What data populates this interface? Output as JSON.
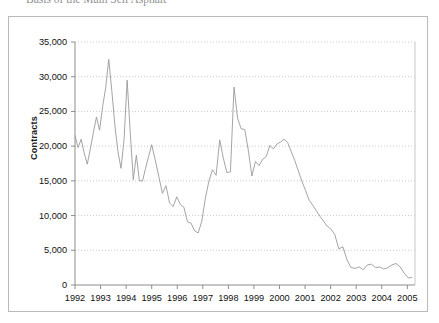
{
  "document": {
    "title_clipped": "Basis of the Main Sell  Asphalt"
  },
  "chart_data": {
    "type": "line",
    "title": "",
    "xlabel": "",
    "ylabel": "Contracts",
    "xlim": [
      1992,
      2005.3
    ],
    "ylim": [
      0,
      35000
    ],
    "grid": true,
    "grid_axis": "y",
    "legend": false,
    "line_color": "#9a9a9a",
    "ytick_labels": [
      "35,000",
      "30,000",
      "25,000",
      "20,000",
      "15,000",
      "10,000",
      "5,000",
      "0"
    ],
    "ytick_values": [
      35000,
      30000,
      25000,
      20000,
      15000,
      10000,
      5000,
      0
    ],
    "xtick_labels": [
      "1992",
      "1993",
      "1994",
      "1995",
      "1996",
      "1997",
      "1998",
      "1999",
      "2000",
      "2001",
      "2002",
      "2003",
      "2004",
      "2005"
    ],
    "xtick_values": [
      1992,
      1993,
      1994,
      1995,
      1996,
      1997,
      1998,
      1999,
      2000,
      2001,
      2002,
      2003,
      2004,
      2005
    ],
    "series": [
      {
        "name": "Contracts",
        "x": [
          1992.0,
          1992.12,
          1992.24,
          1992.36,
          1992.48,
          1992.6,
          1992.72,
          1992.84,
          1992.96,
          1993.08,
          1993.2,
          1993.32,
          1993.44,
          1993.56,
          1993.68,
          1993.8,
          1993.92,
          1994.04,
          1994.16,
          1994.28,
          1994.4,
          1994.52,
          1994.64,
          1994.76,
          1994.88,
          1995.0,
          1995.14,
          1995.28,
          1995.42,
          1995.56,
          1995.7,
          1995.84,
          1995.98,
          1996.12,
          1996.26,
          1996.4,
          1996.54,
          1996.68,
          1996.82,
          1996.96,
          1997.1,
          1997.24,
          1997.38,
          1997.52,
          1997.66,
          1997.8,
          1997.94,
          1998.08,
          1998.22,
          1998.36,
          1998.5,
          1998.64,
          1998.78,
          1998.92,
          1999.06,
          1999.2,
          1999.34,
          1999.48,
          1999.62,
          1999.76,
          1999.9,
          2000.04,
          2000.18,
          2000.32,
          2000.46,
          2000.6,
          2000.74,
          2000.88,
          2001.02,
          2001.16,
          2001.3,
          2001.44,
          2001.58,
          2001.72,
          2001.86,
          2002.0,
          2002.16,
          2002.32,
          2002.48,
          2002.64,
          2002.8,
          2002.96,
          2003.12,
          2003.28,
          2003.44,
          2003.6,
          2003.76,
          2003.92,
          2004.08,
          2004.24,
          2004.4,
          2004.56,
          2004.72,
          2004.88,
          2005.04,
          2005.18
        ],
        "values": [
          21500,
          19800,
          21000,
          19000,
          17400,
          19600,
          22000,
          24200,
          22300,
          25700,
          28400,
          32500,
          28000,
          23000,
          19200,
          16800,
          21000,
          29500,
          22000,
          15200,
          18700,
          15000,
          15000,
          16800,
          18500,
          20200,
          18000,
          15600,
          13200,
          14300,
          11800,
          11300,
          12700,
          11600,
          11200,
          9100,
          8900,
          7800,
          7500,
          9200,
          12500,
          15000,
          16600,
          15800,
          20900,
          18300,
          16200,
          16300,
          28500,
          24000,
          22500,
          22400,
          19400,
          15700,
          17800,
          17200,
          18100,
          18500,
          20100,
          19600,
          20300,
          20600,
          21000,
          20500,
          19200,
          17900,
          16400,
          14900,
          13600,
          12200,
          11500,
          10700,
          9900,
          9200,
          8500,
          8100,
          7300,
          5200,
          5500,
          3600,
          2500,
          2400,
          2600,
          2200,
          2900,
          3000,
          2500,
          2600,
          2300,
          2500,
          2900,
          3100,
          2600,
          1700,
          1000,
          1100
        ]
      }
    ]
  }
}
